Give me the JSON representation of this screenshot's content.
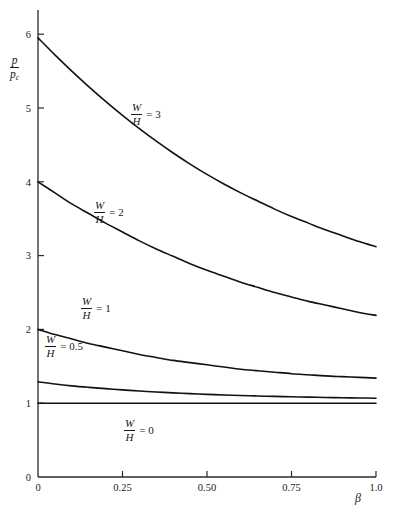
{
  "chart_data": {
    "type": "line",
    "title": "",
    "xlabel": "β",
    "ylabel": "p/p_c",
    "ylabel_numerator": "p",
    "ylabel_denominator": "p",
    "ylabel_denominator_sub": "c",
    "xlim": [
      0,
      1.0
    ],
    "ylim": [
      0,
      6.3
    ],
    "xticks": [
      0,
      0.25,
      0.5,
      0.75,
      1.0
    ],
    "xticklabels": [
      "0",
      "0.25",
      "0.50",
      "0.75",
      "1.0"
    ],
    "yticks": [
      0,
      1,
      2,
      3,
      4,
      5,
      6
    ],
    "yticklabels": [
      "0",
      "1",
      "2",
      "3",
      "4",
      "5",
      "6"
    ],
    "grid": false,
    "legend_position": "inline-annotations",
    "x": [
      0,
      0.05,
      0.1,
      0.15,
      0.2,
      0.25,
      0.3,
      0.35,
      0.4,
      0.45,
      0.5,
      0.55,
      0.6,
      0.65,
      0.7,
      0.75,
      0.8,
      0.85,
      0.9,
      0.95,
      1.0
    ],
    "series": [
      {
        "name": "W/H = 3",
        "label_numerator": "W",
        "label_denominator": "H",
        "label_value": "3",
        "color": "#111111",
        "values": [
          5.95,
          5.72,
          5.5,
          5.29,
          5.09,
          4.9,
          4.72,
          4.55,
          4.39,
          4.24,
          4.1,
          3.97,
          3.85,
          3.74,
          3.63,
          3.53,
          3.44,
          3.35,
          3.27,
          3.19,
          3.12
        ]
      },
      {
        "name": "W/H = 2",
        "label_numerator": "W",
        "label_denominator": "H",
        "label_value": "2",
        "color": "#111111",
        "values": [
          4.0,
          3.85,
          3.7,
          3.57,
          3.44,
          3.32,
          3.2,
          3.09,
          2.99,
          2.89,
          2.8,
          2.72,
          2.64,
          2.57,
          2.5,
          2.44,
          2.38,
          2.33,
          2.28,
          2.23,
          2.19
        ]
      },
      {
        "name": "W/H = 1",
        "label_numerator": "W",
        "label_denominator": "H",
        "label_value": "1",
        "color": "#111111",
        "values": [
          2.0,
          1.93,
          1.87,
          1.81,
          1.76,
          1.71,
          1.66,
          1.62,
          1.58,
          1.55,
          1.52,
          1.49,
          1.46,
          1.44,
          1.42,
          1.4,
          1.385,
          1.37,
          1.36,
          1.35,
          1.34
        ]
      },
      {
        "name": "W/H = 0.5",
        "label_numerator": "W",
        "label_denominator": "H",
        "label_value": "0.5",
        "color": "#111111",
        "values": [
          1.29,
          1.26,
          1.235,
          1.215,
          1.197,
          1.18,
          1.165,
          1.152,
          1.14,
          1.13,
          1.12,
          1.112,
          1.105,
          1.098,
          1.092,
          1.087,
          1.082,
          1.078,
          1.074,
          1.071,
          1.068
        ]
      },
      {
        "name": "W/H = 0",
        "label_numerator": "W",
        "label_denominator": "H",
        "label_value": "0",
        "color": "#111111",
        "values": [
          1.0,
          1.0,
          1.0,
          1.0,
          1.0,
          1.0,
          1.0,
          1.0,
          1.0,
          1.0,
          1.0,
          1.0,
          1.0,
          1.0,
          1.0,
          1.0,
          1.0,
          1.0,
          1.0,
          1.0,
          1.0
        ]
      }
    ],
    "annotations": [
      {
        "text": "W/H = 3",
        "x": 0.375,
        "y": 5.25
      },
      {
        "text": "W/H = 2",
        "x": 0.175,
        "y": 3.6
      },
      {
        "text": "W/H = 1",
        "x": 0.115,
        "y": 2.33
      },
      {
        "text": "W/H = 0.5",
        "x": 0.04,
        "y": 1.8
      },
      {
        "text": "W/H = 0",
        "x": 0.26,
        "y": 0.74
      }
    ]
  }
}
